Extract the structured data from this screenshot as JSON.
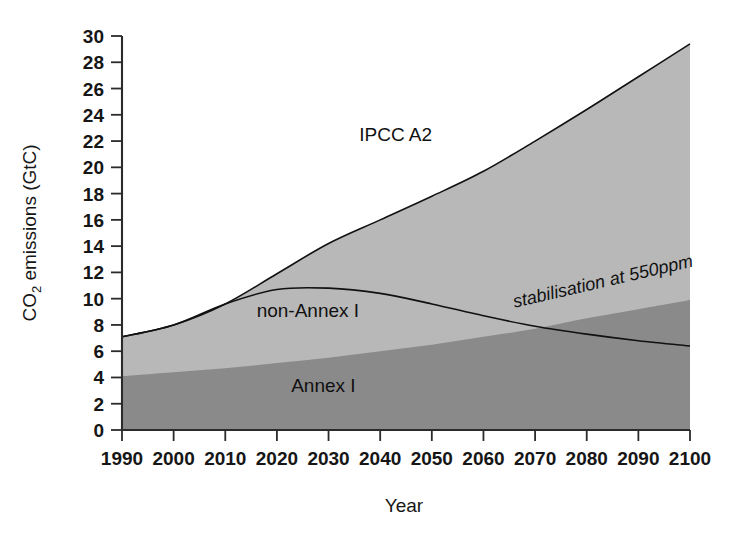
{
  "chart_data": {
    "type": "area",
    "title": "",
    "xlabel": "Year",
    "ylabel": "CO2 emissions (GtC)",
    "ylabel_parts": {
      "pre": "CO",
      "sub": "2",
      "post": " emissions (GtC)"
    },
    "xlim": [
      1990,
      2100
    ],
    "ylim": [
      0,
      30
    ],
    "grid": false,
    "legend_position": "in-plot-annotations",
    "xticks": [
      1990,
      2000,
      2010,
      2020,
      2030,
      2040,
      2050,
      2060,
      2070,
      2080,
      2090,
      2100
    ],
    "yticks": [
      0,
      2,
      4,
      6,
      8,
      10,
      12,
      14,
      16,
      18,
      20,
      22,
      24,
      26,
      28,
      30
    ],
    "x": [
      1990,
      2000,
      2010,
      2020,
      2030,
      2040,
      2050,
      2060,
      2070,
      2080,
      2090,
      2100
    ],
    "series": [
      {
        "name": "IPCC A2",
        "role": "total-emissions-upper-boundary",
        "fill": "#b8b8b8",
        "values": [
          7.1,
          8.0,
          9.6,
          11.9,
          14.2,
          16.0,
          17.8,
          19.7,
          22.0,
          24.4,
          26.9,
          29.4
        ]
      },
      {
        "name": "Annex I",
        "role": "lower-stacked-band",
        "fill": "#8a8a8a",
        "values": [
          4.1,
          4.4,
          4.7,
          5.1,
          5.5,
          6.0,
          6.5,
          7.1,
          7.7,
          8.5,
          9.2,
          9.9
        ]
      },
      {
        "name": "non-Annex I",
        "role": "upper-stacked-band-difference",
        "fill": "#b8b8b8",
        "values": [
          3.0,
          3.6,
          4.9,
          6.8,
          8.7,
          10.0,
          11.3,
          12.6,
          14.3,
          15.9,
          17.7,
          19.5
        ]
      },
      {
        "name": "stabilisation at 550ppm",
        "role": "overlay-line",
        "stroke": "#111111",
        "values": [
          7.1,
          8.0,
          9.6,
          10.7,
          10.8,
          10.4,
          9.6,
          8.7,
          7.9,
          7.3,
          6.8,
          6.4
        ]
      }
    ],
    "annotations": [
      {
        "text": "IPCC A2",
        "x": 2043,
        "y": 22.0,
        "style": "plain"
      },
      {
        "text": "non-Annex I",
        "x": 2026,
        "y": 8.6,
        "style": "plain"
      },
      {
        "text": "Annex I",
        "x": 2029,
        "y": 2.9,
        "style": "plain"
      },
      {
        "text": "stabilisation at 550ppm",
        "x": 2066,
        "y": 9.3,
        "style": "italic-rotated"
      }
    ],
    "colors": {
      "light_gray": "#b8b8b8",
      "dark_gray": "#8a8a8a",
      "line": "#111111",
      "axis": "#2b2b2b",
      "background": "#ffffff"
    }
  }
}
